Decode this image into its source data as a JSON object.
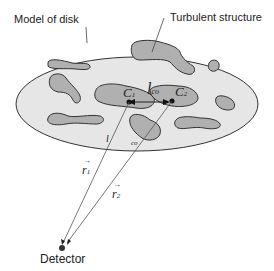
{
  "diagram": {
    "type": "schematic",
    "labels": {
      "model_of_disk": "Model of disk",
      "turbulent_structure": "Turbulent structure",
      "detector": "Detector",
      "c1": "C",
      "c1_sub": "1",
      "c2": "C",
      "c2_sub": "2",
      "l_co": "l",
      "l_co_sub": "co",
      "l_small": "l",
      "co_small": "co",
      "r1": "r",
      "r1_sub": "1",
      "r2": "r",
      "r2_sub": "2",
      "vector_arrow": "→"
    },
    "colors": {
      "disk_fill": "#e6e6e6",
      "blob_fill": "#b0b0b0",
      "stroke": "#333333",
      "line": "#555555",
      "background": "#ffffff"
    },
    "elements": [
      "disk ellipse",
      "turbulent blobs (12)",
      "correlation length arrow between C1 and C2",
      "vector r1 from C1 to detector",
      "vector r2 from C2 to detector",
      "detector point"
    ]
  }
}
